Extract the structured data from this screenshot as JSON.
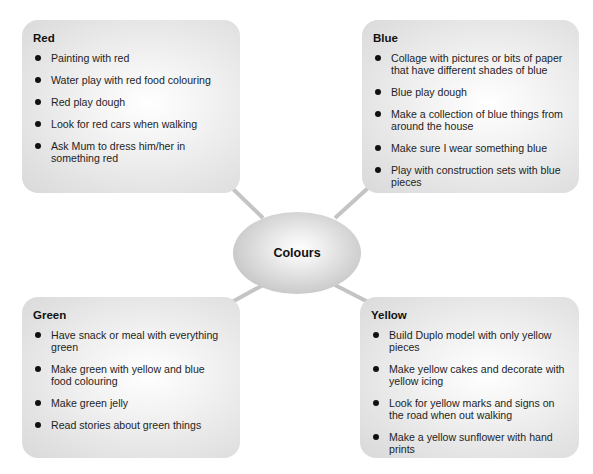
{
  "center": {
    "label": "Colours"
  },
  "colors": {
    "box_fill": "#e2e2e2",
    "connector": "#c4c4c4",
    "ellipse_fill": "#c7c7c7",
    "text": "#1a1a1a"
  },
  "boxes": {
    "red": {
      "title": "Red",
      "items": [
        "Painting with red",
        "Water play with red food colouring",
        "Red play dough",
        "Look for red cars when walking",
        "Ask Mum to dress him/her in something red"
      ]
    },
    "blue": {
      "title": "Blue",
      "items": [
        "Collage with pictures or bits of paper that have different shades of blue",
        "Blue play dough",
        "Make a collection of blue things from around the house",
        "Make sure I wear something blue",
        "Play with construction sets with blue pieces"
      ]
    },
    "green": {
      "title": "Green",
      "items": [
        "Have snack or meal with everything green",
        "Make green with yellow and blue food colouring",
        "Make green jelly",
        "Read stories about green things"
      ]
    },
    "yellow": {
      "title": "Yellow",
      "items": [
        "Build Duplo model with only yellow pieces",
        "Make yellow cakes and decorate with yellow icing",
        "Look for yellow marks and signs on the road when out walking",
        "Make a yellow sunflower with hand prints"
      ]
    }
  }
}
